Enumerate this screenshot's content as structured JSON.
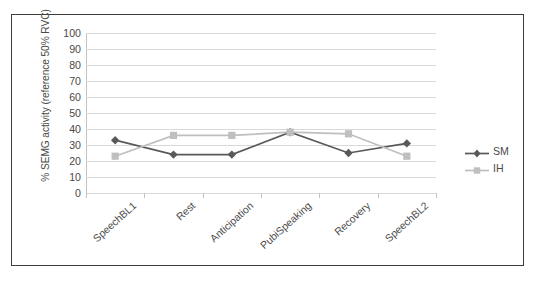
{
  "chart_data": {
    "type": "line",
    "title": "",
    "xlabel": "",
    "ylabel": "% SEMG activity (reference 50% RVC)",
    "ylim": [
      0,
      100
    ],
    "ytick_step": 10,
    "yticks": [
      100,
      90,
      80,
      70,
      60,
      50,
      40,
      30,
      20,
      10,
      0
    ],
    "grid": true,
    "legend_position": "right",
    "categories": [
      "SpeechBL1",
      "Rest",
      "Anticipation",
      "PubiSpeaking",
      "Recovery",
      "SpeechBL2"
    ],
    "series": [
      {
        "name": "SM",
        "color": "#595959",
        "marker": "diamond",
        "values": [
          33,
          24,
          24,
          38,
          25,
          31
        ]
      },
      {
        "name": "IH",
        "color": "#bfbfbf",
        "marker": "square",
        "values": [
          23,
          36,
          36,
          38,
          37,
          23
        ]
      }
    ]
  },
  "axes": {
    "y_title": "% SEMG activity (reference 50% RVC)",
    "y_tick_labels": [
      "100",
      "90",
      "80",
      "70",
      "60",
      "50",
      "40",
      "30",
      "20",
      "10",
      "0"
    ],
    "x_tick_labels": [
      "SpeechBL1",
      "Rest",
      "Anticipation",
      "PubiSpeaking",
      "Recovery",
      "SpeechBL2"
    ]
  },
  "legend": {
    "entries": [
      {
        "label": "SM",
        "color": "#595959",
        "marker": "diamond-marker"
      },
      {
        "label": "IH",
        "color": "#bfbfbf",
        "marker": "square-marker"
      }
    ]
  },
  "style": {
    "frame_color": "#3d3d3d",
    "grid_color": "#d9d9d9",
    "axis_color": "#c3c3c3",
    "text_color": "#4a4a4a",
    "background": "#ffffff"
  }
}
